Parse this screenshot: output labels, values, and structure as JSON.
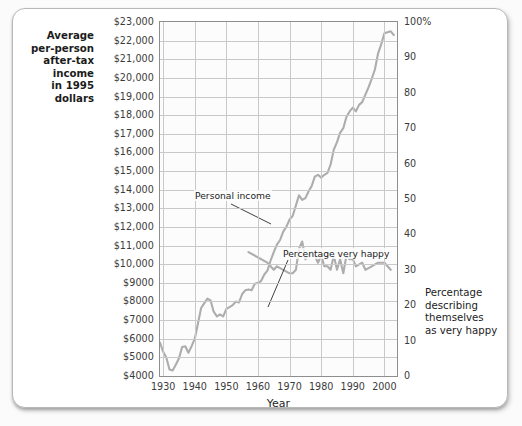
{
  "chart_data": {
    "type": "line",
    "title": "",
    "xlabel": "Year",
    "left_axis_label": "Average per-person after-tax income in 1995 dollars",
    "right_axis_label": "Percentage describing themselves as very happy",
    "grid": true,
    "legend": "inline-annotations",
    "xlim": [
      1929,
      2004
    ],
    "x_ticks": [
      1930,
      1940,
      1950,
      1960,
      1970,
      1980,
      1990,
      2000
    ],
    "left_ylim": [
      4000,
      23000
    ],
    "left_y_ticks": [
      "$23,000",
      "$22,000",
      "$21,000",
      "$20,000",
      "$19,000",
      "$18,000",
      "$17,000",
      "$16,000",
      "$15,000",
      "$14,000",
      "$13,000",
      "$12,000",
      "$11,000",
      "$10,000",
      "$9000",
      "$8000",
      "$7000",
      "$6000",
      "$5000",
      "$4000"
    ],
    "left_y_tick_values": [
      23000,
      22000,
      21000,
      20000,
      19000,
      18000,
      17000,
      16000,
      15000,
      14000,
      13000,
      12000,
      11000,
      10000,
      9000,
      8000,
      7000,
      6000,
      5000,
      4000
    ],
    "right_ylim": [
      0,
      100
    ],
    "right_y_ticks": [
      "100%",
      "90",
      "80",
      "70",
      "60",
      "50",
      "40",
      "30",
      "20",
      "10",
      "0"
    ],
    "right_y_tick_values": [
      100,
      90,
      80,
      70,
      60,
      50,
      40,
      30,
      20,
      10,
      0
    ],
    "series": [
      {
        "name": "Personal income",
        "axis": "left",
        "units": "1995 dollars",
        "color": "#adadad",
        "annotation": "Personal income",
        "x": [
          1929,
          1930,
          1931,
          1932,
          1933,
          1934,
          1935,
          1936,
          1937,
          1938,
          1939,
          1940,
          1941,
          1942,
          1943,
          1944,
          1945,
          1946,
          1947,
          1948,
          1949,
          1950,
          1951,
          1952,
          1953,
          1954,
          1955,
          1956,
          1957,
          1958,
          1959,
          1960,
          1961,
          1962,
          1963,
          1964,
          1965,
          1966,
          1967,
          1968,
          1969,
          1970,
          1971,
          1972,
          1973,
          1974,
          1975,
          1976,
          1977,
          1978,
          1979,
          1980,
          1981,
          1982,
          1983,
          1984,
          1985,
          1986,
          1987,
          1988,
          1989,
          1990,
          1991,
          1992,
          1993,
          1994,
          1995,
          1996,
          1997,
          1998,
          1999,
          2000,
          2001,
          2002,
          2003
        ],
        "y": [
          5800,
          5300,
          5000,
          4350,
          4300,
          4600,
          4950,
          5550,
          5600,
          5250,
          5600,
          6000,
          6800,
          7650,
          7900,
          8150,
          8050,
          7450,
          7200,
          7300,
          7200,
          7600,
          7700,
          7800,
          8000,
          7950,
          8400,
          8600,
          8650,
          8600,
          8950,
          9000,
          9100,
          9450,
          9650,
          10200,
          10650,
          11050,
          11300,
          11750,
          12000,
          12400,
          12600,
          13150,
          13700,
          13450,
          13550,
          13900,
          14200,
          14700,
          14800,
          14650,
          14800,
          14900,
          15350,
          16150,
          16550,
          17050,
          17300,
          17900,
          18200,
          18400,
          18200,
          18550,
          18700,
          19100,
          19500,
          19950,
          20450,
          21300,
          21800,
          22400,
          22450,
          22500,
          22300
        ]
      },
      {
        "name": "Percentage very happy",
        "axis": "right",
        "units": "percent",
        "color": "#adadad",
        "annotation": "Percentage very happy",
        "x": [
          1957,
          1963,
          1965,
          1966,
          1970,
          1971,
          1972,
          1973,
          1974,
          1975,
          1976,
          1977,
          1978,
          1979,
          1980,
          1981,
          1982,
          1983,
          1984,
          1985,
          1986,
          1987,
          1988,
          1989,
          1990,
          1991,
          1993,
          1994,
          1996,
          1998,
          2000,
          2002
        ],
        "y": [
          35,
          32,
          30,
          31,
          29,
          29,
          30,
          36,
          38,
          33,
          34,
          35,
          34,
          32,
          34,
          31,
          31,
          30,
          34,
          30,
          33,
          29,
          34,
          33,
          33,
          31,
          32,
          30,
          31,
          32,
          32,
          30
        ]
      }
    ]
  },
  "annotations": {
    "income": "Personal income",
    "happy": "Percentage very happy"
  },
  "captions": {
    "left": [
      "Average",
      "per-person",
      "after-tax income",
      "in 1995 dollars"
    ],
    "right": [
      "Percentage",
      "describing",
      "themselves",
      "as very happy"
    ]
  }
}
